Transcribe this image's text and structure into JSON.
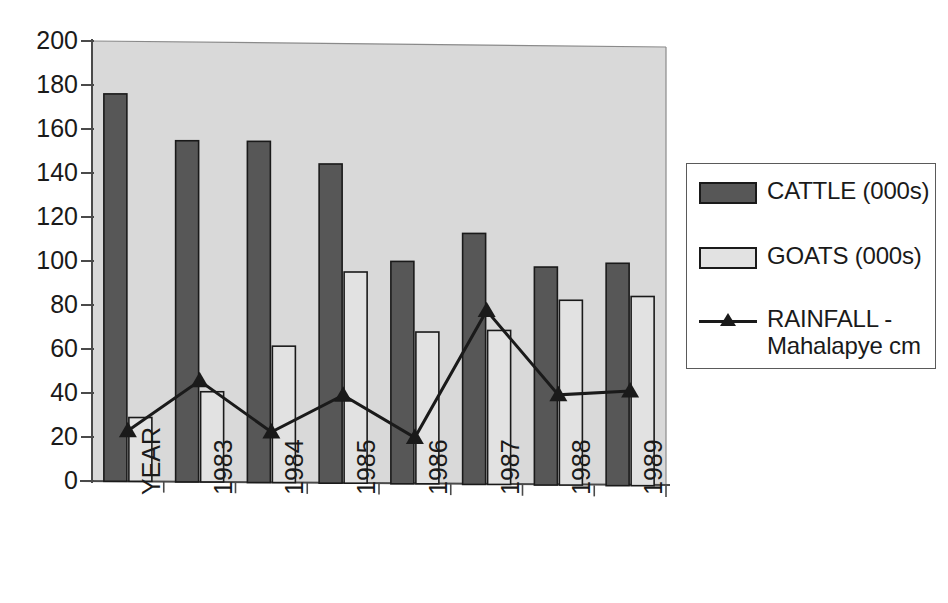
{
  "chart_data": {
    "type": "bar",
    "title": "",
    "subtitle": "",
    "xlabel": "",
    "ylabel": "",
    "categories": [
      "YEAR",
      "1983",
      "1984",
      "1985",
      "1986",
      "1987",
      "1988",
      "1989"
    ],
    "ylim": [
      0,
      200
    ],
    "ytick_step": 20,
    "yticks": [
      0,
      20,
      40,
      60,
      80,
      100,
      120,
      140,
      160,
      180,
      200
    ],
    "ytick_labels": [
      "0",
      "20",
      "40",
      "60",
      "80",
      "100",
      "120",
      "140",
      "160",
      "180",
      "200"
    ],
    "grid": false,
    "legend_position": "right",
    "series": [
      {
        "name": "CATTLE (000s)",
        "type": "bar",
        "color": "#575757",
        "values": [
          176,
          155,
          155,
          145,
          101,
          114,
          99,
          101
        ]
      },
      {
        "name": "GOATS (000s)",
        "type": "bar",
        "color": "#e2e2e2",
        "values": [
          29,
          41,
          62,
          96,
          69,
          70,
          84,
          86
        ]
      },
      {
        "name": "RAINFALL - Mahalapye cm",
        "type": "line",
        "color": "#1a1a1a",
        "marker": "triangle",
        "values": [
          23,
          46,
          23,
          40,
          21,
          79,
          41,
          43
        ]
      }
    ],
    "plot_background": "#d9d9d9",
    "axis_color": "#4a4a4a",
    "bar_outline_color": "#1a1a1a"
  },
  "legend": {
    "items": [
      {
        "label": "CATTLE (000s)",
        "marker": "filled-dark-square",
        "color": "#575757"
      },
      {
        "label": "GOATS (000s)",
        "marker": "filled-light-square",
        "color": "#e2e2e2"
      },
      {
        "label": "RAINFALL -\nMahalapye cm",
        "marker": "line-triangle",
        "color": "#1a1a1a"
      }
    ]
  }
}
